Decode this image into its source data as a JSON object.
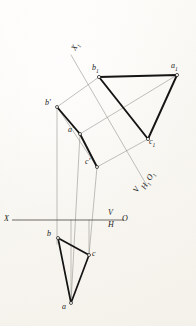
{
  "drawing": {
    "title": "Orthographic projection with auxiliary view of triangle ABC",
    "type": "descriptive-geometry",
    "ink_color": "#1a1a1a",
    "construction_color": "#8d8b86",
    "paper_color": "#f7f5f0",
    "axis_labels": {
      "ground_line_left": "X",
      "ground_line_right": "O",
      "vertical_plane": "V",
      "horizontal_plane": "H",
      "aux_axis": "X",
      "aux_axis_sub": "1",
      "aux_plane_v": "V",
      "aux_plane_h": "H",
      "aux_plane_h_sub": "1",
      "aux_origin": "O",
      "aux_origin_sub": "1"
    },
    "points": {
      "frontal": [
        {
          "name": "b-prime",
          "label": "b",
          "prime": "'",
          "x": 57,
          "y": 107,
          "lx": 46,
          "ly": 101
        },
        {
          "name": "a-prime",
          "label": "a",
          "prime": "'",
          "x": 80,
          "y": 134,
          "lx": 69,
          "ly": 128
        },
        {
          "name": "c-prime",
          "label": "c",
          "prime": "'",
          "x": 97,
          "y": 167,
          "lx": 86,
          "ly": 160
        }
      ],
      "horizontal": [
        {
          "name": "b-top",
          "label": "b",
          "prime": "",
          "x": 58,
          "y": 238,
          "lx": 47,
          "ly": 232
        },
        {
          "name": "c-top",
          "label": "c",
          "prime": "",
          "x": 89,
          "y": 255,
          "lx": 93,
          "ly": 252
        },
        {
          "name": "a-top",
          "label": "a",
          "prime": "",
          "x": 71,
          "y": 303,
          "lx": 63,
          "ly": 303
        }
      ],
      "auxiliary": [
        {
          "name": "b1",
          "label": "b",
          "prime": "",
          "sub": "1",
          "x": 99,
          "y": 77,
          "lx": 93,
          "ly": 66
        },
        {
          "name": "a1",
          "label": "a",
          "prime": "",
          "sub": "1",
          "x": 177,
          "y": 75,
          "lx": 172,
          "ly": 65
        },
        {
          "name": "c1",
          "label": "c",
          "prime": "",
          "sub": "1",
          "x": 148,
          "y": 139,
          "lx": 149,
          "ly": 140
        }
      ]
    },
    "triangles": [
      {
        "name": "frontal-triangle",
        "points": "57,107 80,134 97,167"
      },
      {
        "name": "horizontal-triangle",
        "points": "58,238 89,255 71,303"
      },
      {
        "name": "auxiliary-triangle",
        "points": "99,77 177,75 148,139"
      }
    ],
    "ground_line": {
      "x1": 12,
      "y1": 220,
      "x2": 124,
      "y2": 220
    },
    "aux_axis_line": {
      "x1": 71,
      "y1": 55,
      "x2": 146,
      "y2": 184
    }
  }
}
